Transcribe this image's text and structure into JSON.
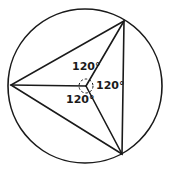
{
  "diagram": {
    "shapes": {
      "circle": "circumscribed-circle",
      "triangle": "inscribed-triangle",
      "radii": [
        "radius-to-top-right-vertex",
        "radius-to-left-vertex",
        "radius-to-bottom-right-vertex"
      ]
    },
    "angle_labels": [
      {
        "id": "angle-top",
        "text": "120°"
      },
      {
        "id": "angle-right",
        "text": "120°"
      },
      {
        "id": "angle-bottom",
        "text": "120°"
      }
    ],
    "central_angle_marker": "dashed-circle",
    "colors": {
      "stroke": "#1a1a1a",
      "background": "#ffffff"
    }
  }
}
